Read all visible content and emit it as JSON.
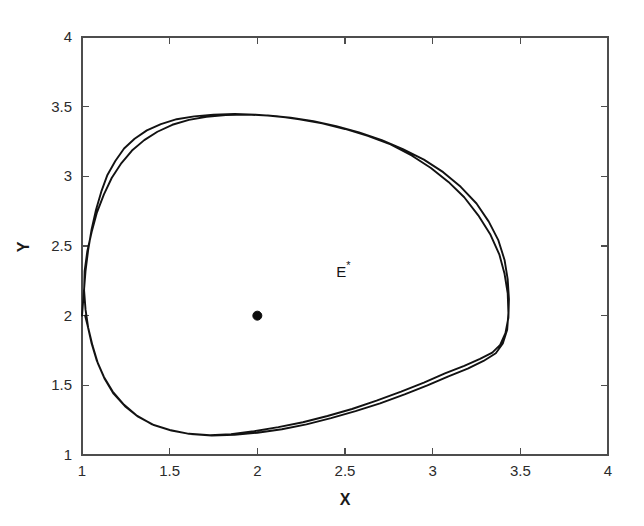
{
  "figure": {
    "background_color": "#ffffff",
    "axis_color": "#4d4d4d",
    "curve_color": "#121212",
    "marker_color": "#0c0c0c"
  },
  "axes": {
    "x_title": "X",
    "y_title": "Y",
    "x_tick_labels": [
      "1",
      "1.5",
      "2",
      "2.5",
      "3",
      "3.5",
      "4"
    ],
    "y_tick_labels": [
      "1",
      "1.5",
      "2",
      "2.5",
      "3",
      "3.5",
      "4"
    ]
  },
  "annotations": {
    "equilibrium_label_base": "E",
    "equilibrium_label_sup": "*"
  },
  "chart_data": {
    "type": "line",
    "title": "",
    "xlabel": "X",
    "ylabel": "Y",
    "xlim": [
      1,
      4
    ],
    "ylim": [
      1,
      4
    ],
    "xticks": [
      1,
      1.5,
      2,
      2.5,
      3,
      3.5,
      4
    ],
    "yticks": [
      1,
      1.5,
      2,
      2.5,
      3,
      3.5,
      4
    ],
    "grid": false,
    "legend": null,
    "tick_direction": "in",
    "box": true,
    "annotations": [
      {
        "text": "E*",
        "x": 2.45,
        "y": 2.28,
        "description": "label for interior equilibrium point"
      }
    ],
    "markers": [
      {
        "name": "equilibrium-point",
        "x": 2.0,
        "y": 2.0,
        "style": "filled-circle",
        "color": "#0c0c0c",
        "size": 9
      }
    ],
    "series": [
      {
        "name": "phase-trajectory-limit-cycle",
        "style": "solid",
        "color": "#121212",
        "description": "Trajectory starting on the left boundary at (1, 2) spiralling outward onto a stable limit cycle surrounding the equilibrium E*(2, 2).",
        "x_range": [
          1.0,
          3.43
        ],
        "y_range": [
          1.13,
          3.44
        ],
        "points": [
          [
            1.0,
            2.0
          ],
          [
            1.01,
            2.16
          ],
          [
            1.02,
            2.32
          ],
          [
            1.035,
            2.47
          ],
          [
            1.055,
            2.62
          ],
          [
            1.08,
            2.76
          ],
          [
            1.11,
            2.89
          ],
          [
            1.145,
            3.01
          ],
          [
            1.19,
            3.11
          ],
          [
            1.24,
            3.2
          ],
          [
            1.3,
            3.27
          ],
          [
            1.37,
            3.33
          ],
          [
            1.45,
            3.375
          ],
          [
            1.54,
            3.41
          ],
          [
            1.64,
            3.43
          ],
          [
            1.75,
            3.443
          ],
          [
            1.87,
            3.447
          ],
          [
            1.99,
            3.443
          ],
          [
            2.11,
            3.432
          ],
          [
            2.24,
            3.41
          ],
          [
            2.37,
            3.38
          ],
          [
            2.5,
            3.34
          ],
          [
            2.63,
            3.29
          ],
          [
            2.76,
            3.23
          ],
          [
            2.88,
            3.15
          ],
          [
            2.99,
            3.06
          ],
          [
            3.09,
            2.96
          ],
          [
            3.18,
            2.85
          ],
          [
            3.26,
            2.72
          ],
          [
            3.33,
            2.58
          ],
          [
            3.38,
            2.44
          ],
          [
            3.41,
            2.3
          ],
          [
            3.428,
            2.16
          ],
          [
            3.432,
            2.02
          ],
          [
            3.425,
            1.9
          ],
          [
            3.4,
            1.8
          ],
          [
            3.36,
            1.73
          ],
          [
            3.29,
            1.675
          ],
          [
            3.2,
            1.62
          ],
          [
            3.09,
            1.565
          ],
          [
            2.97,
            1.5
          ],
          [
            2.84,
            1.435
          ],
          [
            2.7,
            1.37
          ],
          [
            2.56,
            1.315
          ],
          [
            2.42,
            1.265
          ],
          [
            2.28,
            1.22
          ],
          [
            2.14,
            1.185
          ],
          [
            2.0,
            1.16
          ],
          [
            1.87,
            1.145
          ],
          [
            1.74,
            1.14
          ],
          [
            1.62,
            1.15
          ],
          [
            1.51,
            1.175
          ],
          [
            1.41,
            1.215
          ],
          [
            1.32,
            1.275
          ],
          [
            1.245,
            1.35
          ],
          [
            1.18,
            1.44
          ],
          [
            1.13,
            1.545
          ],
          [
            1.09,
            1.66
          ],
          [
            1.06,
            1.785
          ],
          [
            1.035,
            1.915
          ],
          [
            1.02,
            2.045
          ],
          [
            1.012,
            2.18
          ],
          [
            1.015,
            2.32
          ],
          [
            1.03,
            2.46
          ],
          [
            1.055,
            2.6
          ],
          [
            1.085,
            2.74
          ],
          [
            1.125,
            2.87
          ],
          [
            1.17,
            2.99
          ],
          [
            1.225,
            3.095
          ],
          [
            1.285,
            3.185
          ],
          [
            1.355,
            3.26
          ],
          [
            1.43,
            3.32
          ],
          [
            1.515,
            3.37
          ],
          [
            1.61,
            3.405
          ],
          [
            1.71,
            3.428
          ],
          [
            1.82,
            3.44
          ],
          [
            1.94,
            3.443
          ],
          [
            2.06,
            3.437
          ],
          [
            2.19,
            3.42
          ],
          [
            2.32,
            3.395
          ],
          [
            2.45,
            3.36
          ],
          [
            2.58,
            3.315
          ],
          [
            2.71,
            3.26
          ],
          [
            2.83,
            3.195
          ],
          [
            2.95,
            3.12
          ],
          [
            3.06,
            3.03
          ],
          [
            3.16,
            2.925
          ],
          [
            3.25,
            2.805
          ],
          [
            3.32,
            2.675
          ],
          [
            3.375,
            2.54
          ],
          [
            3.41,
            2.4
          ],
          [
            3.428,
            2.26
          ],
          [
            3.435,
            2.12
          ],
          [
            3.432,
            1.985
          ],
          [
            3.415,
            1.875
          ],
          [
            3.385,
            1.79
          ],
          [
            3.34,
            1.735
          ],
          [
            3.27,
            1.69
          ],
          [
            3.18,
            1.64
          ],
          [
            3.07,
            1.585
          ],
          [
            2.95,
            1.52
          ],
          [
            2.82,
            1.455
          ],
          [
            2.68,
            1.39
          ],
          [
            2.54,
            1.33
          ],
          [
            2.4,
            1.28
          ],
          [
            2.26,
            1.235
          ],
          [
            2.12,
            1.2
          ],
          [
            1.98,
            1.17
          ],
          [
            1.85,
            1.15
          ],
          [
            1.73,
            1.142
          ],
          [
            1.61,
            1.152
          ],
          [
            1.5,
            1.18
          ],
          [
            1.4,
            1.22
          ],
          [
            1.31,
            1.285
          ],
          [
            1.24,
            1.36
          ],
          [
            1.175,
            1.455
          ],
          [
            1.125,
            1.56
          ],
          [
            1.085,
            1.675
          ],
          [
            1.055,
            1.8
          ],
          [
            1.032,
            1.93
          ],
          [
            1.018,
            2.0
          ]
        ]
      }
    ]
  }
}
